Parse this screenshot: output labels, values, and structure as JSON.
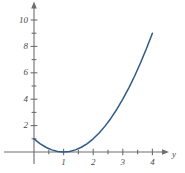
{
  "chart_data": {
    "type": "line",
    "title": "",
    "subtitle": "",
    "xlabel": "y",
    "ylabel": "",
    "function": "(x - 1)^2",
    "xlim": [
      -0.25,
      4.4
    ],
    "ylim": [
      -0.9,
      11.2
    ],
    "grid": false,
    "legend": null,
    "curve_color": "#2d5a87",
    "axis_color": "#6e6e6e",
    "label_color": "#4a4a4a",
    "x_ticks_major": [
      1,
      2,
      3,
      4
    ],
    "x_tick_labels": [
      "1",
      "2",
      "3",
      "4"
    ],
    "x_ticks_minor": [
      0.5,
      1.5,
      2.5,
      3.5
    ],
    "y_ticks_major": [
      2,
      4,
      6,
      8,
      10
    ],
    "y_tick_labels": [
      "2",
      "4",
      "6",
      "8",
      "10"
    ],
    "y_ticks_minor": [
      1,
      3,
      5,
      7,
      9
    ],
    "series": [
      {
        "name": "parabola",
        "x": [
          0,
          0.2,
          0.4,
          0.6,
          0.8,
          1,
          1.2,
          1.4,
          1.6,
          1.8,
          2,
          2.2,
          2.4,
          2.6,
          2.8,
          3,
          3.2,
          3.4,
          3.6,
          3.8,
          4
        ],
        "values": [
          1,
          0.64,
          0.36,
          0.16,
          0.04,
          0,
          0.04,
          0.16,
          0.36,
          0.64,
          1,
          1.44,
          1.96,
          2.56,
          3.24,
          4,
          4.84,
          5.76,
          6.76,
          7.84,
          9
        ]
      }
    ],
    "annotations": []
  },
  "axis_labels": {
    "x_axis_name": "y",
    "y_axis_name": ""
  }
}
